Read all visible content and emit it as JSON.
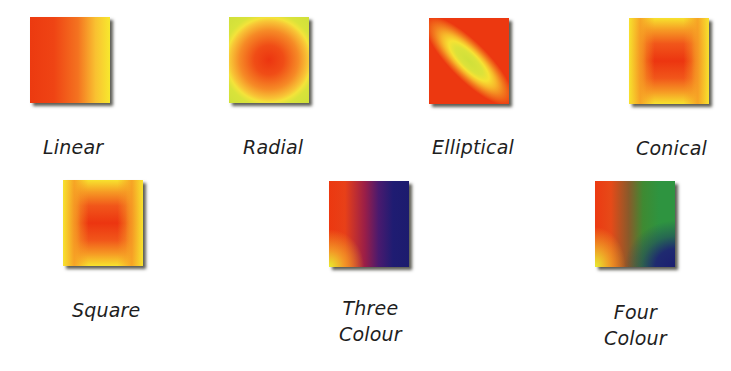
{
  "swatches": [
    {
      "id": "linear",
      "label": "Linear",
      "type": "linear",
      "colors": [
        "#ec3a10",
        "#f7e82e"
      ],
      "direction": "left-to-right"
    },
    {
      "id": "radial",
      "label": "Radial",
      "type": "radial",
      "colors": [
        "#ec3510",
        "#cfe03a"
      ]
    },
    {
      "id": "elliptical",
      "label": "Elliptical",
      "type": "elliptical",
      "colors": [
        "#cfe03a",
        "#ec3810"
      ],
      "axis": "diagonal top-left to bottom-right"
    },
    {
      "id": "conical",
      "label": "Conical",
      "type": "conical",
      "colors": [
        "#ec3510",
        "#f7e22e"
      ]
    },
    {
      "id": "square",
      "label": "Square",
      "type": "square",
      "colors": [
        "#ec3510",
        "#f7e22e"
      ]
    },
    {
      "id": "three",
      "label_line1": "Three",
      "label_line2": "Colour",
      "type": "three-colour",
      "colors": [
        "#ec3810",
        "#e8ee30",
        "#1c1b6e"
      ]
    },
    {
      "id": "four",
      "label_line1": "Four",
      "label_line2": "Colour",
      "type": "four-colour",
      "colors": [
        "#ec3a12",
        "#2e9440",
        "#e8ee30",
        "#1c1e70"
      ]
    }
  ]
}
